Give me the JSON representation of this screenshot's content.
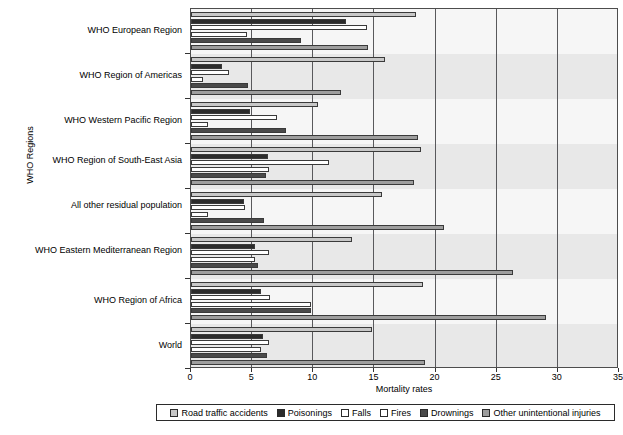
{
  "chart_data": {
    "type": "bar",
    "orientation": "horizontal",
    "title": "",
    "xlabel": "Mortality rates",
    "ylabel": "WHO Regions",
    "xlim": [
      0,
      35
    ],
    "xticks": [
      0,
      5,
      10,
      15,
      20,
      25,
      30,
      35
    ],
    "grid": true,
    "legend_position": "bottom",
    "categories": [
      "WHO European Region",
      "WHO Region of Americas",
      "WHO Western Pacific Region",
      "WHO Region of South-East Asia",
      "All other residual population",
      "WHO Eastern Mediterranean Region",
      "WHO Region of Africa",
      "World"
    ],
    "series": [
      {
        "name": "Road traffic accidents",
        "color": "#c8c8c8",
        "values": [
          18.4,
          15.9,
          10.4,
          18.8,
          15.6,
          13.2,
          19.0,
          14.8
        ]
      },
      {
        "name": "Poisonings",
        "color": "#2b2b2b",
        "values": [
          12.7,
          2.5,
          4.8,
          6.3,
          4.3,
          5.2,
          5.7,
          5.9
        ]
      },
      {
        "name": "Falls",
        "color": "#ffffff",
        "values": [
          14.4,
          3.1,
          7.0,
          11.3,
          4.4,
          6.4,
          6.5,
          6.4
        ]
      },
      {
        "name": "Fires",
        "color": "#ffffff",
        "values": [
          4.6,
          1.0,
          1.4,
          6.4,
          1.4,
          5.2,
          9.8,
          5.7
        ]
      },
      {
        "name": "Drownings",
        "color": "#4a4a4a",
        "values": [
          9.0,
          4.7,
          7.8,
          6.1,
          6.0,
          5.5,
          9.8,
          6.2
        ]
      },
      {
        "name": "Other unintentional injuries",
        "color": "#9e9e9e",
        "values": [
          14.5,
          12.3,
          18.6,
          18.2,
          20.7,
          26.3,
          29.0,
          19.1
        ]
      }
    ]
  },
  "legend": {
    "items": [
      "Road traffic accidents",
      "Poisonings",
      "Falls",
      "Fires",
      "Drownings",
      "Other unintentional injuries"
    ]
  },
  "axis": {
    "x_title": "Mortality rates",
    "y_title": "WHO Regions",
    "x_tick_labels": [
      "0",
      "5",
      "10",
      "15",
      "20",
      "25",
      "30",
      "35"
    ]
  }
}
